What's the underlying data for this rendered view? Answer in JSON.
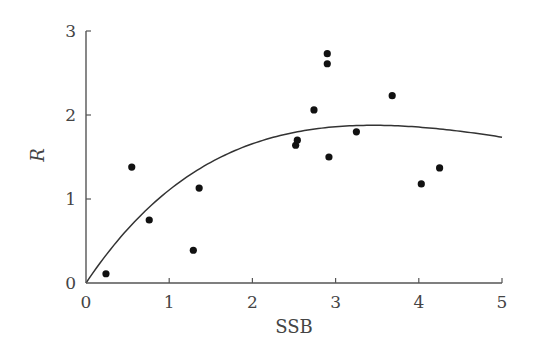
{
  "chart_data": {
    "type": "scatter",
    "title": "",
    "xlabel": "SSB",
    "ylabel": "R",
    "xlim": [
      0,
      5
    ],
    "ylim": [
      0,
      3
    ],
    "xticks": [
      0,
      1,
      2,
      3,
      4,
      5
    ],
    "yticks": [
      0,
      1,
      2,
      3
    ],
    "grid": false,
    "legend": null,
    "series": [
      {
        "name": "observations",
        "kind": "scatter",
        "color": "#111111",
        "points": [
          {
            "x": 0.24,
            "y": 0.11
          },
          {
            "x": 0.55,
            "y": 1.38
          },
          {
            "x": 0.76,
            "y": 0.75
          },
          {
            "x": 1.29,
            "y": 0.39
          },
          {
            "x": 1.36,
            "y": 1.13
          },
          {
            "x": 2.52,
            "y": 1.64
          },
          {
            "x": 2.54,
            "y": 1.7
          },
          {
            "x": 2.74,
            "y": 2.06
          },
          {
            "x": 2.9,
            "y": 2.73
          },
          {
            "x": 2.9,
            "y": 2.61
          },
          {
            "x": 2.92,
            "y": 1.5
          },
          {
            "x": 3.25,
            "y": 1.8
          },
          {
            "x": 3.68,
            "y": 2.23
          },
          {
            "x": 4.03,
            "y": 1.18
          },
          {
            "x": 4.25,
            "y": 1.37
          }
        ]
      },
      {
        "name": "fitted curve (Ricker)",
        "kind": "line",
        "color": "#333333",
        "model": "R = a * SSB * exp(-b * SSB)",
        "params": {
          "a": 1.48,
          "b": 0.29
        },
        "x_range": [
          0,
          5
        ]
      }
    ]
  }
}
